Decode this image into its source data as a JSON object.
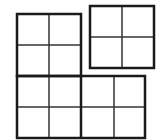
{
  "diagram": {
    "colors": {
      "stroke": "#1a1a1a",
      "background": "#ffffff"
    },
    "shapes": [
      {
        "id": "top-left-square",
        "x": 17,
        "y": 14,
        "w": 64,
        "h": 62,
        "cols": 2,
        "rows": 2
      },
      {
        "id": "top-right-square",
        "x": 90,
        "y": 6,
        "w": 64,
        "h": 62,
        "cols": 2,
        "rows": 2
      },
      {
        "id": "bottom-left-square",
        "x": 17,
        "y": 76,
        "w": 64,
        "h": 62,
        "cols": 2,
        "rows": 2
      },
      {
        "id": "bottom-right-square",
        "x": 81,
        "y": 76,
        "w": 64,
        "h": 62,
        "cols": 2,
        "rows": 2
      }
    ]
  }
}
